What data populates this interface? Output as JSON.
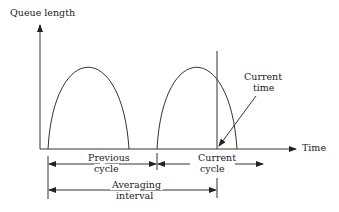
{
  "diagram": {
    "y_axis_label": "Queue length",
    "x_axis_label": "Time",
    "current_time_label_line1": "Current",
    "current_time_label_line2": "time",
    "previous_cycle_line1": "Previous",
    "previous_cycle_line2": "cycle",
    "current_cycle_line1": "Current",
    "current_cycle_line2": "cycle",
    "averaging_line1": "Averaging",
    "averaging_line2": "interval",
    "line_color": "#333333"
  }
}
